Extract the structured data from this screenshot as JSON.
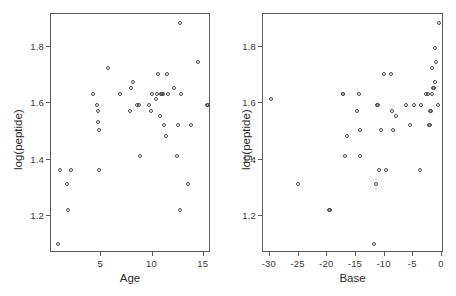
{
  "figure": {
    "background": "#ffffff",
    "marker_color": "#4a4a4a",
    "axis_color": "#5a5a5a",
    "panel_count": 2
  },
  "chart_data": [
    {
      "type": "scatter",
      "panel_name": "age-panel",
      "title": "",
      "xlabel": "Age",
      "ylabel": "log(peptide)",
      "xlim": [
        0.1,
        15.7
      ],
      "ylim": [
        1.07,
        1.915
      ],
      "xticks": [
        5,
        10,
        15
      ],
      "xticklabels": [
        "5",
        "10",
        "15"
      ],
      "yticks": [
        1.2,
        1.4,
        1.6,
        1.8
      ],
      "yticklabels": [
        "1.2",
        "1.4",
        "1.6",
        "1.8"
      ],
      "grid": false,
      "legend": "none",
      "marker": "open-circle",
      "x": [
        0.9,
        1.1,
        1.8,
        1.9,
        2.1,
        4.3,
        4.7,
        4.8,
        4.8,
        4.9,
        4.9,
        5.8,
        6.9,
        7.9,
        8.0,
        8.2,
        8.6,
        8.8,
        8.9,
        9.8,
        9.9,
        10.0,
        10.4,
        10.5,
        10.6,
        10.8,
        10.9,
        11.0,
        11.1,
        11.2,
        11.4,
        11.5,
        11.6,
        12.2,
        12.5,
        12.6,
        12.8,
        12.8,
        12.9,
        13.6,
        13.8,
        14.5,
        15.4,
        15.5
      ],
      "y": [
        1.1,
        1.36,
        1.31,
        1.22,
        1.36,
        1.63,
        1.59,
        1.57,
        1.53,
        1.5,
        1.36,
        1.72,
        1.63,
        1.57,
        1.65,
        1.67,
        1.59,
        1.59,
        1.41,
        1.59,
        1.57,
        1.63,
        1.61,
        1.63,
        1.7,
        1.55,
        1.63,
        1.63,
        1.63,
        1.52,
        1.48,
        1.7,
        1.63,
        1.65,
        1.41,
        1.52,
        1.88,
        1.22,
        1.63,
        1.31,
        1.52,
        1.74,
        1.59,
        1.59
      ]
    },
    {
      "type": "scatter",
      "panel_name": "base-panel",
      "title": "",
      "xlabel": "Base",
      "ylabel": "log(peptide)",
      "xlim": [
        -31.2,
        0.35
      ],
      "ylim": [
        1.07,
        1.915
      ],
      "xticks": [
        -30,
        -25,
        -20,
        -15,
        -10,
        -5,
        0
      ],
      "xticklabels": [
        "-30",
        "-25",
        "-20",
        "-15",
        "-10",
        "-5",
        "0"
      ],
      "yticks": [
        1.2,
        1.4,
        1.6,
        1.8
      ],
      "yticklabels": [
        "1.2",
        "1.4",
        "1.6",
        "1.8"
      ],
      "grid": false,
      "legend": "none",
      "marker": "open-circle",
      "x": [
        -29.6,
        -25.0,
        -19.6,
        -19.4,
        -17.0,
        -17.0,
        -16.7,
        -16.3,
        -14.7,
        -14.3,
        -14.2,
        -14.1,
        -11.7,
        -11.4,
        -11.2,
        -11.0,
        -10.8,
        -10.4,
        -9.9,
        -9.6,
        -8.8,
        -8.5,
        -8.4,
        -7.9,
        -6.1,
        -5.4,
        -4.7,
        -3.6,
        -3.5,
        -2.6,
        -2.2,
        -2.1,
        -2.0,
        -1.9,
        -1.8,
        -1.6,
        -1.5,
        -1.4,
        -1.3,
        -1.1,
        -1.0,
        -0.8,
        -0.6,
        -0.4
      ],
      "y": [
        1.61,
        1.31,
        1.22,
        1.22,
        1.63,
        1.63,
        1.41,
        1.48,
        1.57,
        1.63,
        1.41,
        1.5,
        1.1,
        1.31,
        1.59,
        1.59,
        1.36,
        1.5,
        1.7,
        1.36,
        1.7,
        1.57,
        1.5,
        1.55,
        1.59,
        1.52,
        1.59,
        1.36,
        1.59,
        1.63,
        1.63,
        1.52,
        1.52,
        1.57,
        1.57,
        1.72,
        1.63,
        1.65,
        1.65,
        1.79,
        1.67,
        1.74,
        1.59,
        1.88
      ]
    }
  ]
}
